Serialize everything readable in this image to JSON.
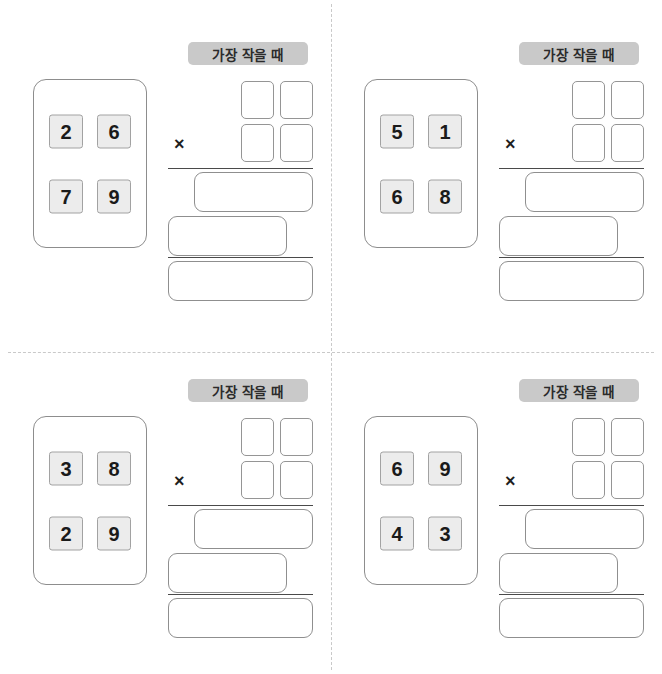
{
  "worksheet": {
    "title": "가장 작을 때 곱셈 만들기 학습지",
    "operator_symbol": "×",
    "colors": {
      "tile_fill": "#ececec",
      "tile_border": "#a2a2a2",
      "badge_fill": "#c9c9c9",
      "card_border": "#8d8d8d",
      "box_border": "#8f8f8f",
      "rule_color": "#4a4a4a",
      "divider_color": "#c9c9c9",
      "page_background": "#ffffff",
      "text_color": "#1a1a1a"
    },
    "layout": {
      "columns": 2,
      "rows": 2,
      "dashed_divider_horizontal": true,
      "dashed_divider_vertical": true
    }
  },
  "problems": [
    {
      "id": "problem-1",
      "position": "top-left",
      "condition_label": "가장 작을 때",
      "operator": "×",
      "digits": [
        "2",
        "6",
        "7",
        "9"
      ],
      "blank_boxes": 4,
      "answer_rows": [
        "",
        "",
        ""
      ]
    },
    {
      "id": "problem-2",
      "position": "top-right",
      "condition_label": "가장 작을 때",
      "operator": "×",
      "digits": [
        "5",
        "1",
        "6",
        "8"
      ],
      "blank_boxes": 4,
      "answer_rows": [
        "",
        "",
        ""
      ]
    },
    {
      "id": "problem-3",
      "position": "bottom-left",
      "condition_label": "가장 작을 때",
      "operator": "×",
      "digits": [
        "3",
        "8",
        "2",
        "9"
      ],
      "blank_boxes": 4,
      "answer_rows": [
        "",
        "",
        ""
      ]
    },
    {
      "id": "problem-4",
      "position": "bottom-right",
      "condition_label": "가장 작을 때",
      "operator": "×",
      "digits": [
        "6",
        "9",
        "4",
        "3"
      ],
      "blank_boxes": 4,
      "answer_rows": [
        "",
        "",
        ""
      ]
    }
  ]
}
